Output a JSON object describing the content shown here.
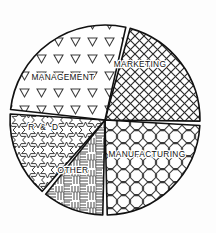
{
  "chart_data": {
    "type": "pie",
    "title": "",
    "subtitle": "",
    "xlabel": "",
    "ylabel": "",
    "legend_position": "none",
    "grid": false,
    "labels_inside_slices": true,
    "style": "monochrome black-and-white hatch patterns",
    "center": {
      "x": 105,
      "y": 120
    },
    "radius": 95,
    "categories": [
      "MARKETING",
      "MANUFACTURING",
      "OTHER",
      "R & D",
      "MANAGEMENT"
    ],
    "values": [
      21.7,
      24.4,
      11.1,
      15.3,
      27.5
    ],
    "slices": [
      {
        "label": "MARKETING",
        "value": 21.7,
        "start_angle": -76,
        "end_angle": 2,
        "pattern": "diagonal-crosshatch-diamond",
        "fill_color": "#ffffff",
        "line_color": "#111111",
        "label_x": 140,
        "label_y": 65,
        "wide_spacing": false
      },
      {
        "label": "MANUFACTURING",
        "value": 24.4,
        "start_angle": 2,
        "end_angle": 90,
        "pattern": "octagon-honeycomb",
        "fill_color": "#ffffff",
        "line_color": "#111111",
        "label_x": 147,
        "label_y": 155,
        "wide_spacing": false
      },
      {
        "label": "OTHER",
        "value": 11.1,
        "start_angle": 90,
        "end_angle": 130,
        "pattern": "basket-weave",
        "fill_color": "#ffffff",
        "line_color": "#111111",
        "label_x": 73,
        "label_y": 171,
        "wide_spacing": false
      },
      {
        "label": "R & D",
        "value": 15.3,
        "start_angle": 130,
        "end_angle": 185,
        "pattern": "six-pointed-stars",
        "fill_color": "#ffffff",
        "line_color": "#111111",
        "label_x": 44,
        "label_y": 128,
        "wide_spacing": true
      },
      {
        "label": "MANAGEMENT",
        "value": 27.5,
        "start_angle": 185,
        "end_angle": 284,
        "pattern": "down-triangles",
        "fill_color": "#ffffff",
        "line_color": "#111111",
        "label_x": 63,
        "label_y": 78,
        "wide_spacing": false
      }
    ]
  }
}
